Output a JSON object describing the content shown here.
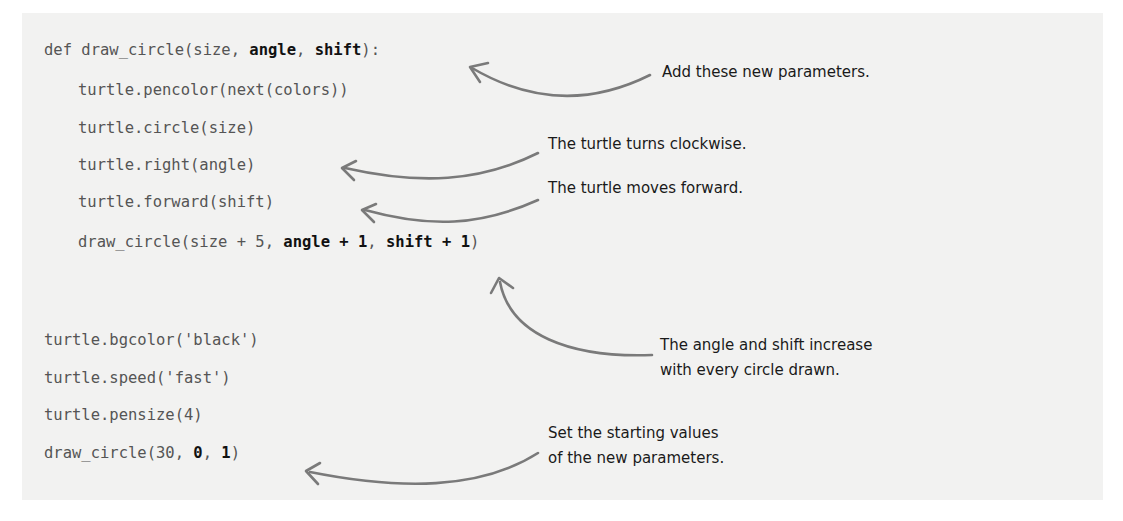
{
  "code": {
    "def_line": {
      "prefix": "def draw_circle(size, ",
      "p1": "angle",
      "sep": ", ",
      "p2": "shift",
      "suffix": "):"
    },
    "pencolor_line": "turtle.pencolor(next(colors))",
    "circle_line": "turtle.circle(size)",
    "right_line": "turtle.right(angle)",
    "forward_line": "turtle.forward(shift)",
    "recurse_line": {
      "prefix": "draw_circle(size + 5, ",
      "p1": "angle + 1",
      "sep": ", ",
      "p2": "shift + 1",
      "suffix": ")"
    },
    "bgcolor_line": "turtle.bgcolor('black')",
    "speed_line": "turtle.speed('fast')",
    "pensize_line": "turtle.pensize(4)",
    "call_line": {
      "prefix": "draw_circle(30, ",
      "p1": "0",
      "sep": ", ",
      "p2": "1",
      "suffix": ")"
    }
  },
  "annotations": {
    "new_params": "Add these new parameters.",
    "turns": "The turtle turns clockwise.",
    "moves": "The turtle moves forward.",
    "increase_1": "The angle and shift increase",
    "increase_2": "with every circle drawn.",
    "starting_1": "Set the starting values",
    "starting_2": "of the new parameters."
  },
  "colors": {
    "panel_bg": "#f2f2f1",
    "code_text": "#555555",
    "code_bold": "#111111",
    "arrow": "#7a7a7a"
  }
}
